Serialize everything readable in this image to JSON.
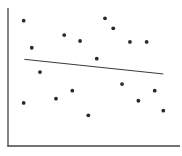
{
  "chart_data": {
    "type": "scatter",
    "title": "",
    "xlabel": "",
    "ylabel": "",
    "xlim": [
      0,
      100
    ],
    "ylim": [
      0,
      100
    ],
    "grid": false,
    "legend": null,
    "ticks": false,
    "series": [
      {
        "name": "points",
        "marker_color": "#2a2a2a",
        "points": [
          {
            "x": 9.1,
            "y": 90.8
          },
          {
            "x": 13.8,
            "y": 71.2
          },
          {
            "x": 18.6,
            "y": 53.6
          },
          {
            "x": 9.1,
            "y": 31.2
          },
          {
            "x": 32.7,
            "y": 80.4
          },
          {
            "x": 41.9,
            "y": 76.1
          },
          {
            "x": 27.9,
            "y": 34.3
          },
          {
            "x": 37.4,
            "y": 40.1
          },
          {
            "x": 46.7,
            "y": 22.2
          },
          {
            "x": 51.6,
            "y": 63.3
          },
          {
            "x": 56.4,
            "y": 92.5
          },
          {
            "x": 61.2,
            "y": 85.3
          },
          {
            "x": 70.9,
            "y": 75.4
          },
          {
            "x": 80.6,
            "y": 75.4
          },
          {
            "x": 66.3,
            "y": 44.9
          },
          {
            "x": 75.8,
            "y": 32.8
          },
          {
            "x": 85.3,
            "y": 40.1
          },
          {
            "x": 90.3,
            "y": 25.6
          }
        ]
      }
    ],
    "trend_line": {
      "type": "linear",
      "color": "#3a3a3a",
      "start": {
        "x": 9.5,
        "y": 62.8
      },
      "end": {
        "x": 90.3,
        "y": 52.2
      }
    },
    "axes": {
      "color": "#444444",
      "show_x_axis": true,
      "show_y_axis": true
    }
  }
}
